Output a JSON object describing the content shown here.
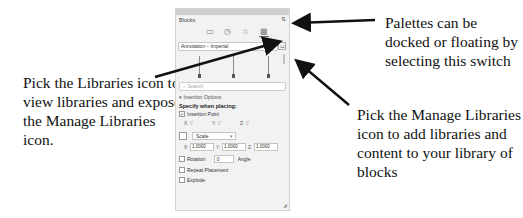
{
  "callouts": {
    "left": "Pick the Libraries icon to view libraries and expose the Manage Libraries icon.",
    "top_right": "Palettes can be docked or floating by selecting this switch",
    "bottom_right": "Pick the Manage Libraries icon to add libraries and content to your library of blocks"
  },
  "panel": {
    "title": "Blocks",
    "dock_toggle_icon": "dock-float-switch-icon",
    "tabs": [
      {
        "name": "current-drawing",
        "glyph": "▭",
        "active": false
      },
      {
        "name": "recent",
        "glyph": "◷",
        "active": false
      },
      {
        "name": "favorites",
        "glyph": "☆",
        "active": false
      },
      {
        "name": "libraries",
        "glyph": "▦",
        "active": true
      }
    ],
    "library_select": "Annotation – Imperial",
    "manage_libraries_glyph": "▭",
    "search_placeholder": "Search",
    "insertion_options_label": "▾ Insertion Options",
    "specify_label": "Specify when placing:",
    "insertion_point": {
      "label": "Insertion Point",
      "checked": true,
      "x_label": "X:",
      "x": "0'",
      "y_label": "Y:",
      "y": "0'",
      "z_label": "Z:",
      "z": "0'"
    },
    "scale": {
      "label": "Scale",
      "checked": false,
      "x_label": "X:",
      "x": "1.0000",
      "y_label": "Y:",
      "y": "1.0000",
      "z_label": "Z:",
      "z": "1.0000"
    },
    "rotation": {
      "label": "Rotation",
      "checked": false,
      "value": "0",
      "unit": "Angle"
    },
    "repeat_placement": {
      "label": "Repeat Placement",
      "checked": false
    },
    "explode": {
      "label": "Explode",
      "checked": false
    }
  }
}
